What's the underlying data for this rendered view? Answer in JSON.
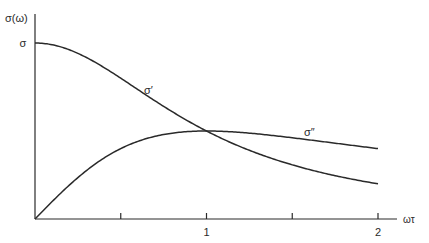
{
  "chart_data": {
    "type": "line",
    "title": "",
    "xlabel": "ωτ",
    "ylabel": "σ(ω)",
    "xlim": [
      0,
      2.05
    ],
    "ylim": [
      0,
      1
    ],
    "y_tick_labels": [
      {
        "value": 1,
        "label": "σ"
      }
    ],
    "x_ticks": [
      0.5,
      1,
      1.5,
      2
    ],
    "x_tick_labels": [
      {
        "value": 1,
        "label": "1"
      },
      {
        "value": 2,
        "label": "2"
      }
    ],
    "grid": false,
    "legend": "inline labels",
    "series": [
      {
        "name": "σ′",
        "label": "σ′",
        "formula": "σ/(1+(ωτ)²)",
        "x": [
          0,
          0.25,
          0.5,
          0.75,
          1.0,
          1.25,
          1.5,
          1.75,
          2.0
        ],
        "values": [
          1.0,
          0.94,
          0.8,
          0.64,
          0.5,
          0.39,
          0.31,
          0.25,
          0.2
        ]
      },
      {
        "name": "σ″",
        "label": "σ″",
        "formula": "σωτ/(1+(ωτ)²)",
        "x": [
          0,
          0.25,
          0.5,
          0.75,
          1.0,
          1.25,
          1.5,
          1.75,
          2.0
        ],
        "values": [
          0.0,
          0.24,
          0.4,
          0.48,
          0.5,
          0.49,
          0.46,
          0.43,
          0.4
        ]
      }
    ],
    "annotations": [
      {
        "text": "σ′",
        "near_series": "σ′",
        "x": 0.65
      },
      {
        "text": "σ″",
        "near_series": "σ″",
        "x": 1.6
      }
    ],
    "line_color": "#2a2a2a"
  }
}
